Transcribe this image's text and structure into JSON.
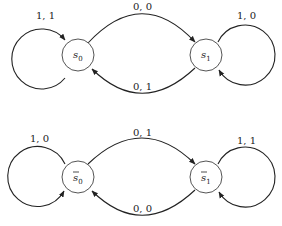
{
  "diagrams": [
    {
      "name": "machine-top",
      "states": [
        {
          "id": "s0",
          "label": "s",
          "subscript": "0",
          "bar": false
        },
        {
          "id": "s1",
          "label": "s",
          "subscript": "1",
          "bar": false
        }
      ],
      "transitions": [
        {
          "from": "s0",
          "to": "s0",
          "label": "1, 1"
        },
        {
          "from": "s0",
          "to": "s1",
          "label": "0, 0"
        },
        {
          "from": "s1",
          "to": "s0",
          "label": "0, 1"
        },
        {
          "from": "s1",
          "to": "s1",
          "label": "1, 0"
        }
      ]
    },
    {
      "name": "machine-bottom",
      "states": [
        {
          "id": "s0bar",
          "label": "s",
          "subscript": "0",
          "bar": true
        },
        {
          "id": "s1bar",
          "label": "s",
          "subscript": "1",
          "bar": true
        }
      ],
      "transitions": [
        {
          "from": "s0bar",
          "to": "s0bar",
          "label": "1, 0"
        },
        {
          "from": "s0bar",
          "to": "s1bar",
          "label": "0, 1"
        },
        {
          "from": "s1bar",
          "to": "s0bar",
          "label": "0, 0"
        },
        {
          "from": "s1bar",
          "to": "s1bar",
          "label": "1, 1"
        }
      ]
    }
  ]
}
